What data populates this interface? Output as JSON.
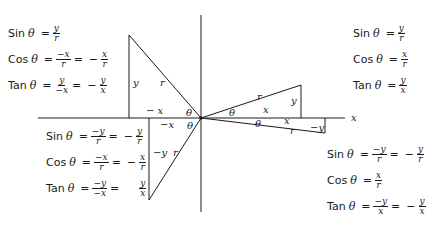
{
  "diagram": {
    "axis_label_x": "x",
    "quadrants": {
      "q1": {
        "labels": {
          "hyp": "r",
          "opp": "y",
          "adj": "x",
          "angle": "θ"
        },
        "equations": [
          {
            "fn": "Sin",
            "theta": "θ",
            "parts": [
              {
                "num": "y",
                "den": "r"
              }
            ]
          },
          {
            "fn": "Cos",
            "theta": "θ",
            "parts": [
              {
                "num": "x",
                "den": "r"
              }
            ]
          },
          {
            "fn": "Tan",
            "theta": "θ",
            "parts": [
              {
                "num": "y",
                "den": "x"
              }
            ]
          }
        ]
      },
      "q2": {
        "labels": {
          "hyp": "r",
          "opp": "y",
          "adj": "− x",
          "angle": "θ"
        },
        "equations": [
          {
            "fn": "Sin",
            "theta": "θ",
            "parts": [
              {
                "num": "y",
                "den": "r"
              }
            ]
          },
          {
            "fn": "Cos",
            "theta": "θ",
            "parts": [
              {
                "num": "−x",
                "den": "r"
              },
              {
                "sign": "−",
                "num": "x",
                "den": "r"
              }
            ]
          },
          {
            "fn": "Tan",
            "theta": "θ",
            "parts": [
              {
                "num": "y",
                "den": "−x"
              },
              {
                "sign": "−",
                "num": "y",
                "den": "x"
              }
            ]
          }
        ]
      },
      "q3": {
        "labels": {
          "hyp": "r",
          "opp": "−y",
          "adj": "−x",
          "angle": "θ"
        },
        "equations": [
          {
            "fn": "Sin",
            "theta": "θ",
            "parts": [
              {
                "num": "−y",
                "den": "r"
              },
              {
                "sign": "−",
                "num": "y",
                "den": "r"
              }
            ]
          },
          {
            "fn": "Cos",
            "theta": "θ",
            "parts": [
              {
                "num": "−x",
                "den": "r"
              },
              {
                "sign": "−",
                "num": "x",
                "den": "r"
              }
            ]
          },
          {
            "fn": "Tan",
            "theta": "θ",
            "parts": [
              {
                "num": "−y",
                "den": "−x"
              },
              {
                "sign": "",
                "num": "y",
                "den": "x"
              }
            ]
          }
        ]
      },
      "q4": {
        "labels": {
          "hyp": "r",
          "opp": "−y",
          "adj": "x",
          "angle": "θ"
        },
        "equations": [
          {
            "fn": "Sin",
            "theta": "θ",
            "parts": [
              {
                "num": "−y",
                "den": "r"
              },
              {
                "sign": "−",
                "num": "y",
                "den": "r"
              }
            ]
          },
          {
            "fn": "Cos",
            "theta": "θ",
            "parts": [
              {
                "num": "x",
                "den": "r"
              }
            ]
          },
          {
            "fn": "Tan",
            "theta": "θ",
            "parts": [
              {
                "num": "−y",
                "den": "x"
              },
              {
                "sign": "−",
                "num": "y",
                "den": "x"
              }
            ]
          }
        ]
      }
    }
  }
}
